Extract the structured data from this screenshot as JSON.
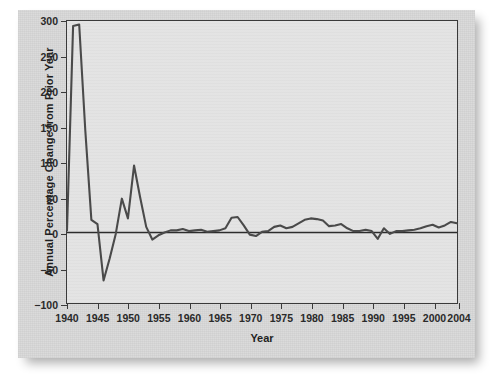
{
  "chart_data": {
    "type": "line",
    "title": "",
    "xlabel": "Year",
    "ylabel": "Annual Percentage Change from Prior Year",
    "xlim": [
      1940,
      2004
    ],
    "ylim": [
      -100,
      300
    ],
    "xticks": [
      1940,
      1945,
      1950,
      1955,
      1960,
      1965,
      1970,
      1975,
      1980,
      1985,
      1990,
      1995,
      2000,
      2004
    ],
    "xtick_labels": [
      "1940",
      "1945",
      "1950",
      "1955",
      "1960",
      "1965",
      "1970",
      "1975",
      "1980",
      "1985",
      "1990",
      "1995",
      "2000",
      "2004"
    ],
    "yticks": [
      -100,
      -50,
      0,
      50,
      100,
      150,
      200,
      250,
      300
    ],
    "ytick_labels": [
      "−100",
      "−50",
      "0",
      "50",
      "100",
      "150",
      "200",
      "250",
      "300"
    ],
    "grid": false,
    "legend": null,
    "zero_line": 0,
    "series": [
      {
        "name": "Annual Percentage Change from Prior Year",
        "color": "#4a4a4a",
        "x": [
          1940,
          1941,
          1942,
          1943,
          1944,
          1945,
          1946,
          1947,
          1948,
          1949,
          1950,
          1951,
          1952,
          1953,
          1954,
          1955,
          1956,
          1957,
          1958,
          1959,
          1960,
          1961,
          1962,
          1963,
          1964,
          1965,
          1966,
          1967,
          1968,
          1969,
          1970,
          1971,
          1972,
          1973,
          1974,
          1975,
          1976,
          1977,
          1978,
          1979,
          1980,
          1981,
          1982,
          1983,
          1984,
          1985,
          1986,
          1987,
          1988,
          1989,
          1990,
          1991,
          1992,
          1993,
          1994,
          1995,
          1996,
          1997,
          1998,
          1999,
          2000,
          2001,
          2002,
          2003,
          2004
        ],
        "y": [
          3,
          293,
          295,
          145,
          18,
          12,
          -68,
          -37,
          -2,
          48,
          20,
          95,
          50,
          8,
          -10,
          -4,
          0,
          3,
          3,
          5,
          2,
          3,
          4,
          1,
          2,
          3,
          6,
          21,
          22,
          10,
          -3,
          -5,
          1,
          2,
          8,
          10,
          6,
          8,
          13,
          18,
          20,
          19,
          17,
          9,
          10,
          12,
          6,
          2,
          2,
          4,
          2,
          -9,
          6,
          -2,
          2,
          2,
          3,
          4,
          6,
          9,
          11,
          7,
          10,
          15,
          13
        ]
      }
    ]
  }
}
